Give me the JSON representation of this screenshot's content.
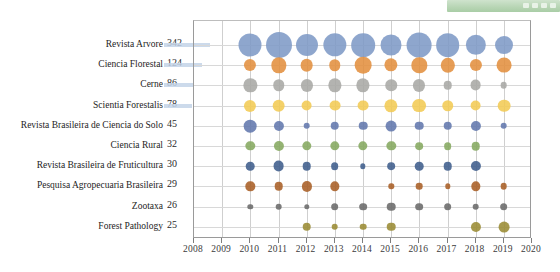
{
  "decor": {
    "green_bar_label": "toolbar-fragment"
  },
  "chart_data": {
    "type": "scatter",
    "title": "",
    "xlabel": "",
    "ylabel": "",
    "xlim": [
      2008,
      2020
    ],
    "grid": true,
    "legend": "none",
    "bubble_note": "Bubble area proportional to number of publications per journal per year",
    "x_ticks": [
      "2008",
      "2009",
      "2010",
      "2011",
      "2012",
      "2013",
      "2014",
      "2015",
      "2016",
      "2017",
      "2018",
      "2019",
      "2020"
    ],
    "categories": [
      "Revista Arvore",
      "Ciencia Florestal",
      "Cerne",
      "Scientia Forestalis",
      "Revista Brasileira de Ciencia do Solo",
      "Ciencia Rural",
      "Revista Brasileira de Fruticultura",
      "Pesquisa Agropecuaria Brasileira",
      "Zootaxa",
      "Forest Pathology"
    ],
    "totals": [
      342,
      124,
      86,
      78,
      45,
      32,
      30,
      29,
      26,
      25
    ],
    "colors": [
      "#7e9ac6",
      "#e3903f",
      "#a8a8a5",
      "#f3cb54",
      "#6277ad",
      "#85a860",
      "#3f5d8c",
      "#a85e25",
      "#6a6a6a",
      "#9a8b33"
    ],
    "x": [
      2010,
      2011,
      2012,
      2013,
      2014,
      2015,
      2016,
      2017,
      2018,
      2019
    ],
    "series": [
      {
        "name": "Revista Arvore",
        "values": [
          36,
          46,
          33,
          37,
          38,
          30,
          42,
          38,
          28,
          22
        ]
      },
      {
        "name": "Ciencia Florestal",
        "values": [
          10,
          16,
          11,
          9,
          19,
          12,
          16,
          14,
          10,
          15
        ]
      },
      {
        "name": "Cerne",
        "values": [
          12,
          9,
          10,
          12,
          12,
          9,
          10,
          5,
          8,
          3
        ]
      },
      {
        "name": "Scientia Forestalis",
        "values": [
          10,
          11,
          8,
          8,
          8,
          12,
          13,
          9,
          8,
          11
        ]
      },
      {
        "name": "Revista Brasileira de Ciencia do Solo",
        "values": [
          11,
          7,
          3,
          5,
          5,
          8,
          5,
          5,
          7,
          3
        ]
      },
      {
        "name": "Ciencia Rural",
        "values": [
          6,
          7,
          6,
          6,
          6,
          6,
          4,
          4,
          5,
          0
        ]
      },
      {
        "name": "Revista Brasileira de Fruticultura",
        "values": [
          5,
          8,
          5,
          4,
          2,
          4,
          5,
          5,
          7,
          0
        ]
      },
      {
        "name": "Pesquisa Agropecuaria Brasileira",
        "values": [
          6,
          5,
          7,
          6,
          0,
          2,
          3,
          2,
          6,
          3
        ]
      },
      {
        "name": "Zootaxa",
        "values": [
          2,
          3,
          2,
          4,
          4,
          5,
          4,
          4,
          3,
          4
        ]
      },
      {
        "name": "Forest Pathology",
        "values": [
          0,
          0,
          5,
          3,
          3,
          5,
          0,
          0,
          7,
          8
        ]
      }
    ]
  }
}
